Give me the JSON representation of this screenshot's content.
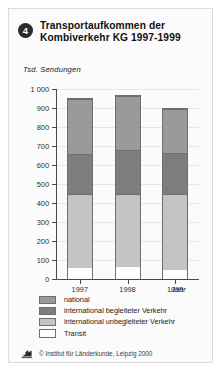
{
  "card": {
    "badge_number": "4",
    "title": "Transportaufkommen der Kombiverkehr KG 1997-1999"
  },
  "footer": {
    "credit": "© Institut für Länderkunde, Leipzig 2000",
    "logo_icon": "institute-logo-icon"
  },
  "colors": {
    "national": "#9a9a9a",
    "international_begleitet": "#7d7d7d",
    "international_unbegleitet": "#c4c4c4",
    "transit": "#ffffff",
    "axis": "#4a4a4a",
    "grid": "#e6e6e6",
    "badge": "#2b2b2b"
  },
  "chart_data": {
    "type": "bar",
    "stacked": true,
    "title": "Transportaufkommen der Kombiverkehr KG 1997-1999",
    "xlabel": "Jahr",
    "ylabel": "Tsd. Sendungen",
    "ylim": [
      0,
      1000
    ],
    "yticks": [
      0,
      100,
      200,
      300,
      400,
      500,
      600,
      700,
      800,
      900,
      1000
    ],
    "ytick_labels": [
      "0",
      "100",
      "200",
      "300",
      "400",
      "500",
      "600",
      "700",
      "800",
      "900",
      "1 000"
    ],
    "grid": true,
    "legend_position": "below",
    "categories": [
      "1997",
      "1998",
      "1999"
    ],
    "series": [
      {
        "name": "Transit",
        "values": [
          62,
          68,
          52
        ],
        "color": "#ffffff"
      },
      {
        "name": "international unbegleiteter Verkehr",
        "values": [
          393,
          382,
          403
        ],
        "color": "#c4c4c4"
      },
      {
        "name": "international begleiteter Verkehr",
        "values": [
          210,
          235,
          215
        ],
        "color": "#7d7d7d"
      },
      {
        "name": "national",
        "values": [
          290,
          285,
          230
        ],
        "color": "#9a9a9a"
      }
    ],
    "totals": [
      955,
      970,
      900
    ]
  }
}
